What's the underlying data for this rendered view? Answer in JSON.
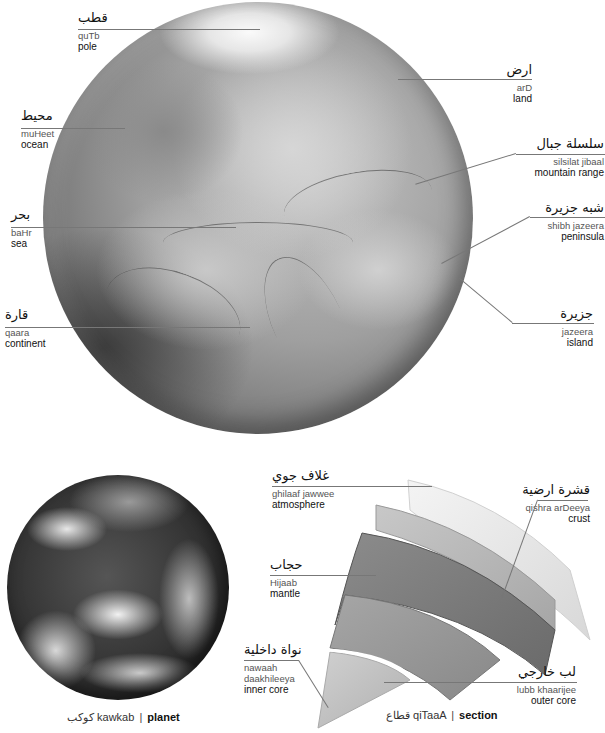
{
  "globe": {
    "name": "globe-relief",
    "labels": {
      "pole": {
        "arabic": "قطب",
        "translit": "quTb",
        "english": "pole"
      },
      "ocean": {
        "arabic": "محيط",
        "translit": "muHeet",
        "english": "ocean"
      },
      "sea": {
        "arabic": "بحر",
        "translit": "baHr",
        "english": "sea"
      },
      "continent": {
        "arabic": "قارة",
        "translit": "qaara",
        "english": "continent"
      },
      "land": {
        "arabic": "ارض",
        "translit": "arD",
        "english": "land"
      },
      "mountain_range": {
        "arabic": "سلسلة جبال",
        "translit": "silsilat jibaal",
        "english": "mountain range"
      },
      "peninsula": {
        "arabic": "شبه جزيرة",
        "translit": "shibh jazeera",
        "english": "peninsula"
      },
      "island": {
        "arabic": "جزيرة",
        "translit": "jazeera",
        "english": "island"
      }
    }
  },
  "planet": {
    "caption": {
      "arabic": "كوكب",
      "translit": "kawkab",
      "separator": "|",
      "english": "planet"
    }
  },
  "section": {
    "labels": {
      "atmosphere": {
        "arabic": "غلاف جوي",
        "translit": "ghilaaf jawwee",
        "english": "atmosphere"
      },
      "crust": {
        "arabic": "قشرة ارضية",
        "translit": "qishra arDeeya",
        "english": "crust"
      },
      "mantle": {
        "arabic": "حجاب",
        "translit": "Hijaab",
        "english": "mantle"
      },
      "inner_core": {
        "arabic": "نواة داخلية",
        "translit_line1": "nawaah",
        "translit_line2": "daakhileeya",
        "english": "inner core"
      },
      "outer_core": {
        "arabic": "لب خارجي",
        "translit": "lubb khaarijee",
        "english": "outer core"
      }
    },
    "caption": {
      "arabic": "قطاع",
      "translit": "qiTaaA",
      "separator": "|",
      "english": "section"
    }
  },
  "colors": {
    "leader_line": "#777777",
    "text_primary": "#111111",
    "text_translit": "#555555",
    "background": "#ffffff"
  }
}
